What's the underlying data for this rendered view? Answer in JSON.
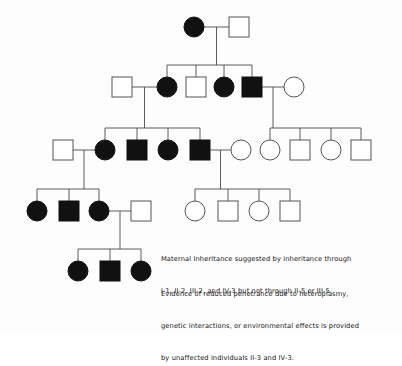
{
  "figure": {
    "type": "pedigree-chart",
    "background_color": "#fdfdfd",
    "line_color": "#4a4a4a",
    "affected_color": "#111111",
    "unaffected_color": "#ffffff",
    "symbol_stroke_color": "#555555"
  },
  "legend": {
    "paragraph_1": {
      "lines": [
        "Maternal Inheritance suggested by inheritance through",
        "I-1, II-2, III-2, and IV-3 but not through II-5 or III-5."
      ]
    },
    "paragraph_2": {
      "lines": [
        "Evidence of reduced penetrance due to heteroplasmy,",
        "genetic interactions, or environmental effects is provided",
        "by unaffected individuals II-3 and IV-3."
      ]
    }
  },
  "chart_data": {
    "type": "pedigree",
    "legend_entries": [
      {
        "symbol": "filled-circle",
        "meaning": "affected female"
      },
      {
        "symbol": "filled-square",
        "meaning": "affected male"
      },
      {
        "symbol": "open-circle",
        "meaning": "unaffected female"
      },
      {
        "symbol": "open-square",
        "meaning": "unaffected male"
      }
    ],
    "generations": [
      {
        "label": "I",
        "y": 27,
        "individuals": [
          {
            "id": "I-1",
            "sex": "female",
            "shape": "circle",
            "affected": true,
            "x": 194
          },
          {
            "id": "I-2",
            "sex": "male",
            "shape": "square",
            "affected": false,
            "x": 239
          }
        ]
      },
      {
        "label": "II",
        "y": 87,
        "individuals": [
          {
            "id": "II-s1",
            "sex": "male",
            "shape": "square",
            "affected": false,
            "x": 122,
            "spouse": true
          },
          {
            "id": "II-2",
            "sex": "female",
            "shape": "circle",
            "affected": true,
            "x": 167
          },
          {
            "id": "II-3",
            "sex": "male",
            "shape": "square",
            "affected": false,
            "x": 196
          },
          {
            "id": "II-4",
            "sex": "female",
            "shape": "circle",
            "affected": true,
            "x": 224
          },
          {
            "id": "II-5",
            "sex": "male",
            "shape": "square",
            "affected": true,
            "x": 252
          },
          {
            "id": "II-s2",
            "sex": "female",
            "shape": "circle",
            "affected": false,
            "x": 294,
            "spouse": true
          }
        ]
      },
      {
        "label": "III",
        "y": 150,
        "individuals": [
          {
            "id": "III-s1",
            "sex": "male",
            "shape": "square",
            "affected": false,
            "x": 63,
            "spouse": true
          },
          {
            "id": "III-2",
            "sex": "female",
            "shape": "circle",
            "affected": true,
            "x": 105
          },
          {
            "id": "III-3",
            "sex": "male",
            "shape": "square",
            "affected": true,
            "x": 137
          },
          {
            "id": "III-4",
            "sex": "female",
            "shape": "circle",
            "affected": true,
            "x": 168
          },
          {
            "id": "III-5",
            "sex": "male",
            "shape": "square",
            "affected": true,
            "x": 200
          },
          {
            "id": "III-s2",
            "sex": "female",
            "shape": "circle",
            "affected": false,
            "x": 241,
            "spouse": true
          },
          {
            "id": "III-6",
            "sex": "female",
            "shape": "circle",
            "affected": false,
            "x": 270
          },
          {
            "id": "III-7",
            "sex": "male",
            "shape": "square",
            "affected": false,
            "x": 300
          },
          {
            "id": "III-8",
            "sex": "female",
            "shape": "circle",
            "affected": false,
            "x": 331
          },
          {
            "id": "III-9",
            "sex": "male",
            "shape": "square",
            "affected": false,
            "x": 361
          }
        ]
      },
      {
        "label": "IV",
        "y": 211,
        "individuals": [
          {
            "id": "IV-1",
            "sex": "female",
            "shape": "circle",
            "affected": true,
            "x": 37
          },
          {
            "id": "IV-2",
            "sex": "male",
            "shape": "square",
            "affected": true,
            "x": 69
          },
          {
            "id": "IV-3",
            "sex": "female",
            "shape": "circle",
            "affected": true,
            "x": 99
          },
          {
            "id": "IV-s1",
            "sex": "male",
            "shape": "square",
            "affected": false,
            "x": 141,
            "spouse": true
          },
          {
            "id": "IV-4",
            "sex": "female",
            "shape": "circle",
            "affected": false,
            "x": 195
          },
          {
            "id": "IV-5",
            "sex": "male",
            "shape": "square",
            "affected": false,
            "x": 228
          },
          {
            "id": "IV-6",
            "sex": "female",
            "shape": "circle",
            "affected": false,
            "x": 259
          },
          {
            "id": "IV-7",
            "sex": "male",
            "shape": "square",
            "affected": false,
            "x": 290
          }
        ]
      },
      {
        "label": "V",
        "y": 271,
        "individuals": [
          {
            "id": "V-1",
            "sex": "female",
            "shape": "circle",
            "affected": true,
            "x": 78
          },
          {
            "id": "V-2",
            "sex": "male",
            "shape": "square",
            "affected": true,
            "x": 110
          },
          {
            "id": "V-3",
            "sex": "female",
            "shape": "circle",
            "affected": true,
            "x": 141
          }
        ]
      }
    ],
    "matings": [
      {
        "parents": [
          "I-1",
          "I-2"
        ],
        "children": [
          "II-2",
          "II-3",
          "II-4",
          "II-5"
        ]
      },
      {
        "parents": [
          "II-s1",
          "II-2"
        ],
        "children": [
          "III-2",
          "III-3",
          "III-4",
          "III-5"
        ]
      },
      {
        "parents": [
          "II-5",
          "II-s2"
        ],
        "children": [
          "III-6",
          "III-7",
          "III-8",
          "III-9"
        ]
      },
      {
        "parents": [
          "III-s1",
          "III-2"
        ],
        "children": [
          "IV-1",
          "IV-2",
          "IV-3"
        ]
      },
      {
        "parents": [
          "III-5",
          "III-s2"
        ],
        "children": [
          "IV-4",
          "IV-5",
          "IV-6",
          "IV-7"
        ]
      },
      {
        "parents": [
          "IV-3",
          "IV-s1"
        ],
        "children": [
          "V-1",
          "V-2",
          "V-3"
        ]
      }
    ],
    "counts": {
      "total_individuals": 29,
      "affected": 13,
      "unaffected": 16
    }
  }
}
